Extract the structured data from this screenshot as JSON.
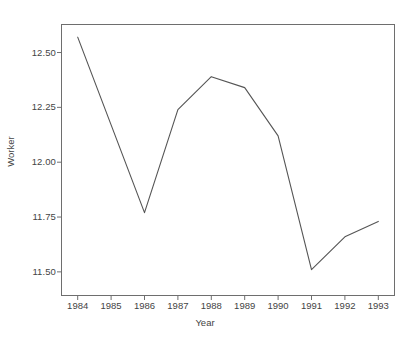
{
  "chart_data": {
    "type": "line",
    "title": "",
    "subtitle": "",
    "xlabel": "Year",
    "ylabel": "Worker",
    "categories": [
      "1984",
      "1985",
      "1986",
      "1987",
      "1988",
      "1989",
      "1990",
      "1991",
      "1992",
      "1993"
    ],
    "x": [
      1984,
      1985,
      1986,
      1987,
      1988,
      1989,
      1990,
      1991,
      1992,
      1993
    ],
    "values": [
      12.57,
      12.17,
      11.77,
      12.24,
      12.39,
      12.34,
      12.12,
      11.51,
      11.66,
      11.73
    ],
    "series": [
      {
        "name": "Worker",
        "values": [
          12.57,
          12.17,
          11.77,
          12.24,
          12.39,
          12.34,
          12.12,
          11.51,
          11.66,
          11.73
        ]
      }
    ],
    "xlim": [
      1983.5,
      1993.5
    ],
    "ylim": [
      11.39,
      12.63
    ],
    "yticks": [
      11.5,
      11.75,
      12.0,
      12.25,
      12.5
    ],
    "ytick_labels": [
      "11.50",
      "11.75",
      "12.00",
      "12.25",
      "12.50"
    ],
    "xticks": [
      1984,
      1985,
      1986,
      1987,
      1988,
      1989,
      1990,
      1991,
      1992,
      1993
    ],
    "xtick_labels": [
      "1984",
      "1985",
      "1986",
      "1987",
      "1988",
      "1989",
      "1990",
      "1991",
      "1992",
      "1993"
    ],
    "grid": false,
    "legend": false,
    "legend_position": "none",
    "line_color": "#555555",
    "frame_color": "#6e6e6e",
    "background_color": "#ffffff",
    "text_color": "#444444"
  }
}
